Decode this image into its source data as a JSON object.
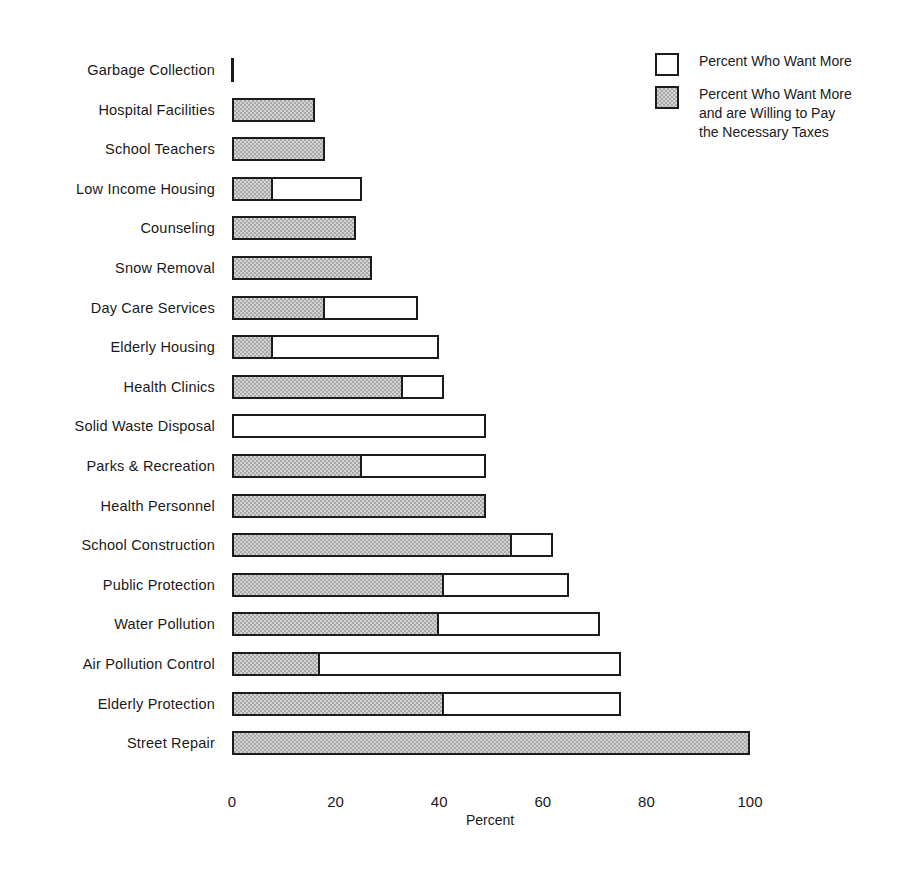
{
  "chart": {
    "type": "bar",
    "orientation": "horizontal",
    "xlabel": "Percent",
    "ylabel": "",
    "title": "",
    "xlim": [
      0,
      100
    ],
    "xticks": [
      "0",
      "20",
      "40",
      "60",
      "80",
      "100"
    ],
    "grid": false,
    "legend_position": "top-right"
  },
  "legend": {
    "entries": [
      {
        "label": "Percent Who Want More",
        "swatch": "white"
      },
      {
        "label": "Percent Who Want More\nand are Willing to Pay\nthe Necessary Taxes",
        "swatch": "hatched"
      }
    ]
  },
  "chart_data": {
    "type": "bar",
    "orientation": "horizontal",
    "stacked": true,
    "title": "",
    "xlabel": "Percent",
    "ylabel": "",
    "xlim": [
      0,
      100
    ],
    "xticks": [
      0,
      20,
      40,
      60,
      80,
      100
    ],
    "grid": false,
    "legend": [
      "Percent Who Want More",
      "Percent Who Want More and are Willing to Pay the Necessary Taxes"
    ],
    "legend_position": "top-right",
    "categories": [
      "Garbage Collection",
      "Hospital Facilities",
      "School Teachers",
      "Low Income Housing",
      "Counseling",
      "Snow Removal",
      "Day Care Services",
      "Elderly Housing",
      "Health Clinics",
      "Solid Waste Disposal",
      "Parks & Recreation",
      "Health Personnel",
      "School Construction",
      "Public Protection",
      "Water Pollution",
      "Air Pollution Control",
      "Elderly Protection",
      "Street Repair"
    ],
    "series": [
      {
        "name": "Percent Who Want More",
        "values": [
          0,
          16,
          18,
          25,
          24,
          27,
          36,
          40,
          41,
          49,
          49,
          49,
          62,
          65,
          71,
          75,
          75,
          100
        ]
      },
      {
        "name": "Percent Who Want More and are Willing to Pay the Necessary Taxes",
        "values": [
          0,
          16,
          18,
          8,
          24,
          27,
          18,
          8,
          33,
          0,
          25,
          49,
          54,
          41,
          40,
          17,
          41,
          100
        ]
      }
    ]
  }
}
